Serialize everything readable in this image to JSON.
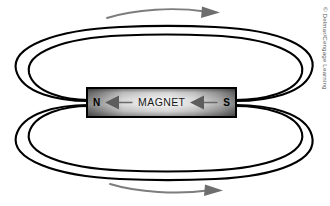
{
  "figure": {
    "background_color": "#ffffff"
  },
  "magnet": {
    "label": "MAGNET",
    "north_pole": "N",
    "south_pole": "S",
    "north_arrow_icon": "left-arrow-icon",
    "south_arrow_icon": "left-arrow-icon",
    "body_color_light": "#eeeeee",
    "body_color_dark": "#6b6b6b",
    "outline_color": "#000000"
  },
  "field": {
    "line_color": "#000000",
    "loops": [
      {
        "name": "upper-outer-loop",
        "cx": 163,
        "cy": 66,
        "rx": 148,
        "ry": 38
      },
      {
        "name": "upper-inner-loop",
        "cx": 163,
        "cy": 68,
        "rx": 136,
        "ry": 32
      },
      {
        "name": "lower-outer-loop",
        "cx": 163,
        "cy": 140,
        "rx": 148,
        "ry": 38
      },
      {
        "name": "lower-inner-loop",
        "cx": 163,
        "cy": 138,
        "rx": 136,
        "ry": 32
      }
    ]
  },
  "direction_arrows": [
    {
      "name": "top-direction-arrow",
      "direction": "right",
      "color": "#7d7d7d"
    },
    {
      "name": "bottom-direction-arrow",
      "direction": "right",
      "color": "#7d7d7d"
    }
  ],
  "credit": {
    "text": "© Delmar/Cengage Learning",
    "color": "#5a5a5a"
  }
}
